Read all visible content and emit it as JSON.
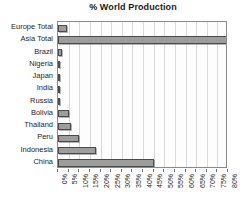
{
  "chart_data": {
    "type": "bar",
    "orientation": "horizontal",
    "title": "% World Production",
    "xlabel": "",
    "ylabel": "",
    "xlim": [
      0,
      80
    ],
    "xtick_step": 5,
    "grid": true,
    "legend": "none",
    "categories": [
      "Europe Total",
      "Asia Total",
      "Brazil",
      "Nigeria",
      "Japan",
      "India",
      "Russia",
      "Bolivia",
      "Thailand",
      "Peru",
      "Indonesia",
      "China"
    ],
    "values": [
      4,
      80,
      2,
      0.3,
      0.3,
      0.6,
      0.3,
      5,
      6,
      10,
      18,
      45
    ],
    "tick_labels": [
      "0%",
      "5%",
      "10%",
      "15%",
      "20%",
      "25%",
      "30%",
      "35%",
      "40%",
      "45%",
      "50%",
      "55%",
      "60%",
      "65%",
      "70%",
      "75%",
      "80%"
    ]
  },
  "style": {
    "bar_fill": "#9d9d9d",
    "bar_stroke": "#4a4a4a",
    "grid_color": "#d8d8d8",
    "frame_color": "#8a8a8a",
    "text_color": "#242424"
  }
}
